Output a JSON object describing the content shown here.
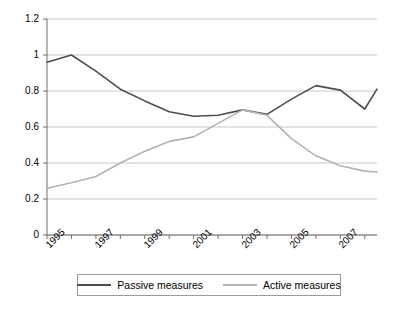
{
  "chart_data": {
    "type": "line",
    "title": "",
    "xlabel": "",
    "ylabel": "",
    "x": [
      1995,
      1996,
      1997,
      1998,
      1999,
      2000,
      2001,
      2002,
      2003,
      2004,
      2005,
      2006,
      2007,
      2008
    ],
    "xlim": [
      1995,
      2008.5
    ],
    "ylim": [
      0,
      1.2
    ],
    "grid": true,
    "legend_position": "bottom",
    "series": [
      {
        "name": "Passive measures",
        "color": "#4d4d4d",
        "values": [
          0.96,
          1.0,
          0.91,
          0.81,
          0.745,
          0.685,
          0.66,
          0.665,
          0.695,
          0.67,
          0.755,
          0.83,
          0.805,
          0.7
        ],
        "final_value": 0.81
      },
      {
        "name": "Active measures",
        "color": "#b3b3b3",
        "values": [
          0.26,
          0.29,
          0.325,
          0.4,
          0.465,
          0.52,
          0.545,
          0.62,
          0.695,
          0.665,
          0.535,
          0.44,
          0.385,
          0.355
        ],
        "final_value": 0.35
      }
    ],
    "yticks": [
      0,
      0.2,
      0.4,
      0.6,
      0.8,
      1,
      1.2
    ],
    "ytick_labels": [
      "0",
      "0.2",
      "0.4",
      "0.6",
      "0.8",
      "1",
      "1.2"
    ],
    "xticks": [
      1995,
      1996,
      1997,
      1998,
      1999,
      2000,
      2001,
      2002,
      2003,
      2004,
      2005,
      2006,
      2007,
      2008
    ],
    "xtick_labels": [
      "1995",
      "",
      "1997",
      "",
      "1999",
      "",
      "2001",
      "",
      "2003",
      "",
      "2005",
      "",
      "2007",
      ""
    ]
  },
  "legend": {
    "items": [
      {
        "label": "Passive measures"
      },
      {
        "label": "Active measures"
      }
    ]
  }
}
